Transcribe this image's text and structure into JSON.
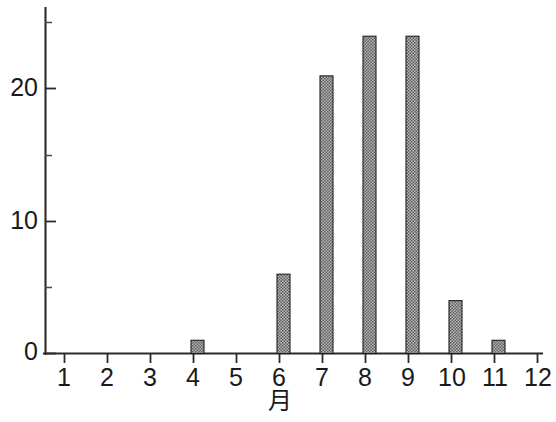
{
  "chart_data": {
    "type": "bar",
    "title": "",
    "subtitle": "",
    "xlabel": "月",
    "ylabel": "",
    "categories": [
      "1",
      "2",
      "3",
      "4",
      "5",
      "6",
      "7",
      "8",
      "9",
      "10",
      "11",
      "12"
    ],
    "values": [
      0,
      0,
      0,
      1,
      0,
      6,
      21,
      24,
      24,
      4,
      1,
      0
    ],
    "series": [
      {
        "name": "",
        "values": [
          0,
          0,
          0,
          1,
          0,
          6,
          21,
          24,
          24,
          4,
          1,
          0
        ]
      }
    ],
    "xlim": [
      0.5,
      12.5
    ],
    "ylim": [
      0,
      26
    ],
    "y_major_ticks": [
      0,
      10,
      20
    ],
    "y_major_tick_labels": [
      "0",
      "10",
      "20"
    ],
    "y_minor_ticks": [
      5,
      15,
      25
    ],
    "x_tick_labels": [
      "1",
      "2",
      "3",
      "4",
      "5",
      "6",
      "7",
      "8",
      "9",
      "10",
      "11",
      "12"
    ],
    "grid": false,
    "legend": null,
    "legend_position": "none",
    "annotations": [],
    "bar_fill_color": "#8f8f8f",
    "bar_edge_color": "#1f1f1f",
    "axis_color": "#2b2b2b",
    "background_color": "#ffffff"
  },
  "axis": {
    "x_label": "月",
    "y_labels": [
      "0",
      "10",
      "20"
    ],
    "x_labels": [
      "1",
      "2",
      "3",
      "4",
      "5",
      "6",
      "7",
      "8",
      "9",
      "10",
      "11",
      "12"
    ]
  }
}
